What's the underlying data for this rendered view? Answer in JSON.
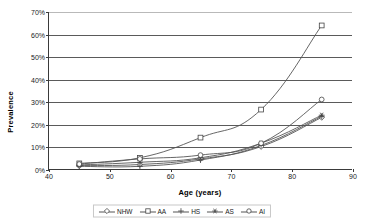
{
  "chart_data": {
    "type": "line",
    "title": "",
    "xlabel": "Age (years)",
    "ylabel": "Prevalence",
    "x": [
      45,
      55,
      65,
      75,
      85
    ],
    "xlim": [
      40,
      90
    ],
    "ylim": [
      0,
      70
    ],
    "xticks": [
      "40",
      "50",
      "60",
      "70",
      "80",
      "90"
    ],
    "yticks": [
      "0%",
      "10%",
      "20%",
      "30%",
      "40%",
      "50%",
      "60%",
      "70%"
    ],
    "grid": "horizontal",
    "legend_position": "bottom-center",
    "series": [
      {
        "name": "NHW",
        "marker": "diamond",
        "values": [
          1.5,
          2.0,
          4.5,
          10.0,
          23.0
        ]
      },
      {
        "name": "AA",
        "marker": "square",
        "values": [
          2.5,
          5.0,
          14.0,
          26.5,
          64.0
        ]
      },
      {
        "name": "HS",
        "marker": "plus",
        "values": [
          1.2,
          1.2,
          4.0,
          10.5,
          23.5
        ]
      },
      {
        "name": "AS",
        "marker": "star",
        "values": [
          1.8,
          3.0,
          5.0,
          11.5,
          24.0
        ]
      },
      {
        "name": "AI",
        "marker": "circle",
        "values": [
          2.2,
          4.5,
          6.2,
          11.5,
          31.0
        ]
      }
    ]
  },
  "legend": {
    "items": [
      {
        "label": "NHW"
      },
      {
        "label": "AA"
      },
      {
        "label": "HS"
      },
      {
        "label": "AS"
      },
      {
        "label": "AI"
      }
    ]
  }
}
